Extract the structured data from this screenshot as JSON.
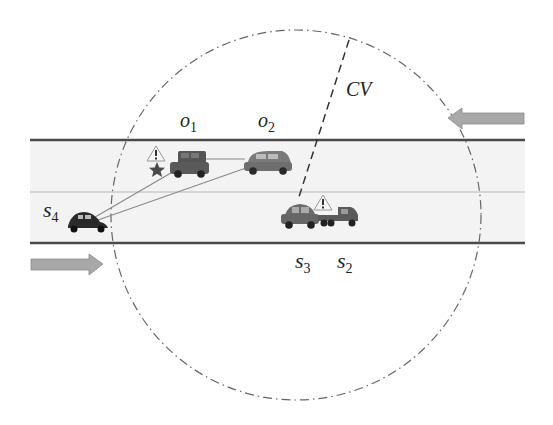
{
  "diagram": {
    "type": "traffic-scenario",
    "labels": {
      "o1": "o",
      "o1_sub": "1",
      "o2": "o",
      "o2_sub": "2",
      "s2": "s",
      "s2_sub": "2",
      "s3": "s",
      "s3_sub": "3",
      "s4": "s",
      "s4_sub": "4",
      "cv": "CV"
    },
    "road": {
      "lanes": 2,
      "top_line_y": 140,
      "middle_line_y": 192,
      "bottom_line_y": 243
    },
    "arrows": [
      {
        "direction": "left",
        "lane": "upper"
      },
      {
        "direction": "right",
        "lane": "lower"
      }
    ],
    "coverage_circle": {
      "center": [
        296,
        215
      ],
      "radius": 185,
      "style": "dash-dot"
    },
    "vehicles": [
      {
        "id": "o1",
        "kind": "suv",
        "color": "#555555",
        "icons": [
          "warning-triangle",
          "star"
        ]
      },
      {
        "id": "o2",
        "kind": "hatchback",
        "color": "#707070"
      },
      {
        "id": "s3",
        "kind": "sedan",
        "color": "#6a6a6a"
      },
      {
        "id": "s2",
        "kind": "truck-cab",
        "color": "#5a5a5a",
        "icons": [
          "warning-triangle"
        ]
      },
      {
        "id": "s4",
        "kind": "beetle",
        "color": "#2a2a2a"
      }
    ],
    "colors": {
      "road_fill": "#f2f2f2",
      "road_line": "#555555",
      "arrow_fill": "#a8a8a8",
      "circle_stroke": "#666666",
      "link_line": "#888888"
    }
  }
}
